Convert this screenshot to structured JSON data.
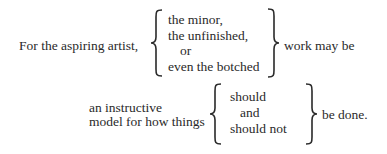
{
  "block1": {
    "lead": "For the aspiring artist,",
    "items": [
      "the minor,",
      "the unfinished,",
      "or",
      "even the botched"
    ],
    "tail": "work may be"
  },
  "block2": {
    "lead_lines": [
      "an instructive",
      "model for how things"
    ],
    "items": [
      "should",
      "and",
      "should not"
    ],
    "tail": "be done."
  },
  "colors": {
    "text": "#2a2a2a",
    "background": "#ffffff"
  }
}
